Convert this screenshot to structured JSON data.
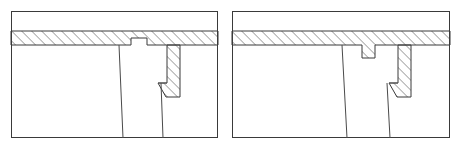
{
  "figure": {
    "type": "engineering-cross-section-pair",
    "background_color": "#ffffff",
    "outline_color": "#3a3a3a",
    "hatch_color": "#4a4a4a",
    "thin_line_color": "#555555",
    "hatch_angle_degrees": 45,
    "hatch_spacing_px": 5
  },
  "panels": [
    {
      "id": "panel-left",
      "label": "Left cross-section detail",
      "frame": {
        "x": 11,
        "y": 11,
        "width": 207,
        "height": 127
      },
      "hatched_band": {
        "name": "upper-hatched-slab",
        "top_y": 31,
        "bottom_y": 45,
        "left_x": 11,
        "right_x": 218,
        "notch": {
          "name": "recess-notch",
          "left_x": 131,
          "right_x": 147,
          "depth_top_y": 38,
          "direction": "upward-recess"
        }
      },
      "hatched_column": {
        "name": "vertical-hatched-rib",
        "left_x": 167,
        "right_x": 180,
        "top_y": 45,
        "step_y": 77,
        "step_left_x": 158,
        "chamfer_start_y": 83,
        "bottom_y": 97,
        "chamfer": "45-degree-lower-left"
      },
      "interior_lines": [
        {
          "name": "left-joint-line",
          "x1": 119,
          "y1": 45,
          "x2": 123,
          "y2": 138
        },
        {
          "name": "right-joint-line",
          "x1": 161,
          "y1": 83,
          "x2": 163,
          "y2": 138
        }
      ]
    },
    {
      "id": "panel-right",
      "label": "Right cross-section detail",
      "frame": {
        "x": 232,
        "y": 11,
        "width": 218,
        "height": 127
      },
      "hatched_band": {
        "name": "upper-hatched-slab",
        "top_y": 31,
        "bottom_y": 45,
        "left_x": 232,
        "right_x": 450,
        "notch": {
          "name": "projecting-tab",
          "left_x": 362,
          "right_x": 375,
          "depth_bottom_y": 58,
          "direction": "downward-projection"
        }
      },
      "hatched_column": {
        "name": "vertical-hatched-rib",
        "left_x": 398,
        "right_x": 411,
        "top_y": 45,
        "step_y": 77,
        "step_left_x": 389,
        "chamfer_start_y": 83,
        "bottom_y": 97,
        "chamfer": "45-degree-lower-left"
      },
      "interior_lines": [
        {
          "name": "left-joint-line",
          "x1": 342,
          "y1": 45,
          "x2": 347,
          "y2": 138
        },
        {
          "name": "right-joint-line",
          "x1": 387,
          "y1": 83,
          "x2": 390,
          "y2": 138
        }
      ]
    }
  ]
}
